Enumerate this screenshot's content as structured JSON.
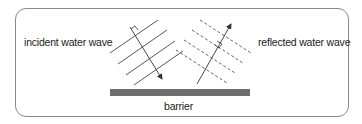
{
  "labels": {
    "incident": "incident water wave",
    "reflected": "reflected water wave",
    "barrier": "barrier"
  },
  "colors": {
    "line": "#333333",
    "barrier": "#6e6e6e",
    "frame": "#8a8a8a"
  },
  "diagram": {
    "incident_wavefronts": 4,
    "reflected_wavefronts": 4,
    "incident_wavefront_style": "solid",
    "reflected_wavefront_style": "dashed",
    "incident_ray": "arrow pointing down-right toward barrier",
    "reflected_ray": "arrow pointing up-right away from barrier",
    "right_angle_markers": 2
  }
}
